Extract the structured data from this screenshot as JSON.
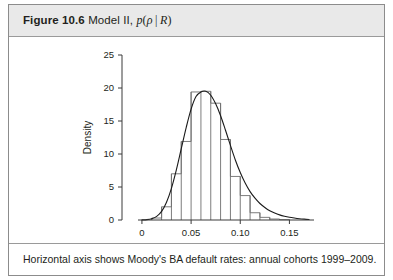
{
  "figure": {
    "number_label": "Figure 10.6",
    "title_text": "Model II,",
    "title_math_p": "p",
    "title_math_open": "(",
    "title_math_rho": "ρ",
    "title_math_bar": "|",
    "title_math_R": "R",
    "title_math_close": ")",
    "caption": "Horizontal axis shows Moody's BA default rates: annual cohorts 1999–2009."
  },
  "chart_data": {
    "type": "bar",
    "xlabel": "ρ",
    "ylabel": "Density",
    "xlim": [
      -0.004,
      0.175
    ],
    "ylim": [
      0,
      25
    ],
    "grid": false,
    "legend": null,
    "x_ticks": [
      0,
      0.05,
      0.1,
      0.15
    ],
    "x_tick_labels": [
      "0",
      "0.05",
      "0.10",
      "0.15"
    ],
    "y_ticks": [
      0,
      5,
      10,
      15,
      20,
      25
    ],
    "y_tick_labels": [
      "0",
      "5",
      "10",
      "15",
      "20",
      "25"
    ],
    "bin_width": 0.01,
    "bin_edges": [
      0.01,
      0.02,
      0.03,
      0.04,
      0.05,
      0.06,
      0.07,
      0.08,
      0.09,
      0.1,
      0.11,
      0.12,
      0.13,
      0.14,
      0.15
    ],
    "values": [
      0.3,
      2.0,
      7.0,
      11.9,
      19.4,
      19.5,
      17.7,
      12.2,
      6.6,
      3.7,
      1.1,
      0.4,
      0.15,
      0.05
    ],
    "curve_label": "density estimate",
    "curve_x": [
      0.0,
      0.005,
      0.01,
      0.015,
      0.02,
      0.025,
      0.03,
      0.035,
      0.04,
      0.045,
      0.05,
      0.055,
      0.06,
      0.065,
      0.07,
      0.075,
      0.08,
      0.085,
      0.09,
      0.095,
      0.1,
      0.105,
      0.11,
      0.115,
      0.12,
      0.125,
      0.13,
      0.135,
      0.14,
      0.145,
      0.15,
      0.155,
      0.16,
      0.165,
      0.17
    ],
    "curve_y": [
      0.02,
      0.06,
      0.2,
      0.55,
      1.3,
      2.7,
      4.8,
      7.6,
      10.8,
      14.0,
      16.8,
      18.7,
      19.4,
      19.5,
      18.9,
      17.6,
      15.8,
      13.6,
      11.3,
      9.1,
      7.2,
      5.6,
      4.3,
      3.3,
      2.5,
      1.9,
      1.4,
      1.05,
      0.78,
      0.58,
      0.42,
      0.3,
      0.2,
      0.13,
      0.08
    ]
  }
}
